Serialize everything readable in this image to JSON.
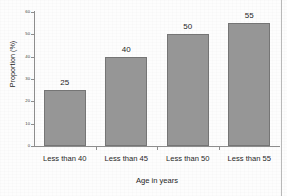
{
  "figure": {
    "top_cutoff_text": "",
    "background_color": "#fdfdfd",
    "bar_fill_color": "#969696",
    "bar_border_color": "#757575",
    "axis_color": "#8d8d8d",
    "text_color": "#1f1f1f"
  },
  "chart_data": {
    "type": "bar",
    "title": "",
    "subtitle": "",
    "categories": [
      "Less than 40",
      "Less than 45",
      "Less than 50",
      "Less than 55"
    ],
    "values": [
      25,
      40,
      50,
      55
    ],
    "data_labels": [
      "25",
      "40",
      "50",
      "55"
    ],
    "xlabel": "Age in years",
    "ylabel": "Proportion (%)",
    "ylim": [
      0,
      60
    ],
    "yticks": [
      0,
      10,
      20,
      30,
      40,
      50,
      60
    ],
    "ytick_labels": [
      "0",
      "10",
      "20",
      "30",
      "40",
      "50",
      "60"
    ],
    "grid": false,
    "legend": false,
    "legend_position": "none",
    "orientation": "vertical",
    "series": [
      {
        "name": "Proportion (%)",
        "values": [
          25,
          40,
          50,
          55
        ]
      }
    ]
  }
}
